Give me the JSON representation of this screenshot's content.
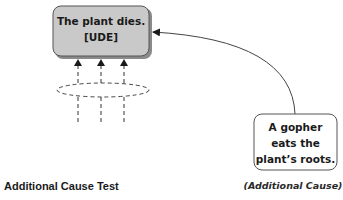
{
  "diagram": {
    "effect_box": {
      "line1": "The plant dies.",
      "line2": "[UDE]",
      "fill": "#c9c9c9"
    },
    "cause_box": {
      "line1": "A gopher",
      "line2": "eats the",
      "line3": "plant’s roots.",
      "fill": "#ffffff"
    },
    "cause_label": "(Additional Cause)",
    "title": "Additional Cause Test"
  }
}
